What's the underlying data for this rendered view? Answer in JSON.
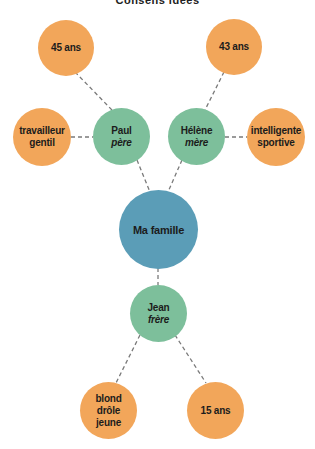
{
  "title": "Conseils idées",
  "colors": {
    "attribute": "#F2A65A",
    "person": "#7DBF9B",
    "center": "#5B9DB7",
    "link": "#7a7a7a"
  },
  "center": {
    "label": "Ma famille"
  },
  "people": [
    {
      "name": "Paul",
      "relation": "père"
    },
    {
      "name": "Hélène",
      "relation": "mère"
    },
    {
      "name": "Jean",
      "relation": "frère"
    }
  ],
  "attributes": {
    "paul_age": "45 ans",
    "paul_traits": [
      "travailleur",
      "gentil"
    ],
    "helene_age": "43 ans",
    "helene_traits": [
      "intelligente",
      "sportive"
    ],
    "jean_traits": [
      "blond",
      "drôle",
      "jeune"
    ],
    "jean_age": "15 ans"
  }
}
